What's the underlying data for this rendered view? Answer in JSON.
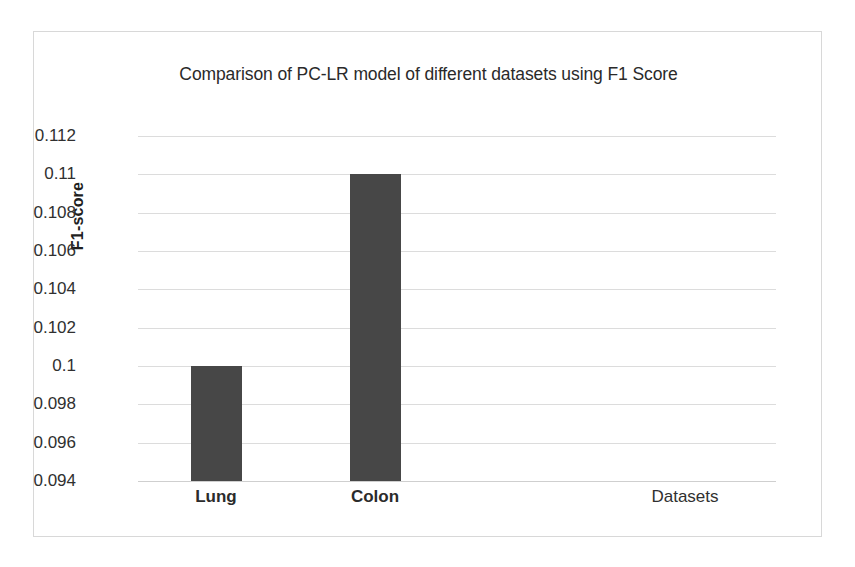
{
  "chart_data": {
    "type": "bar",
    "title": "Comparison of PC-LR model of different datasets using F1 Score",
    "categories": [
      "Lung",
      "Colon"
    ],
    "values": [
      0.1,
      0.11
    ],
    "xlabel": "Datasets",
    "ylabel": "F1-score",
    "ylim": [
      0.094,
      0.112
    ],
    "ytick_step": 0.002,
    "ytick_labels": [
      "0.112",
      "0.11",
      "0.108",
      "0.106",
      "0.104",
      "0.102",
      "0.1",
      "0.098",
      "0.096",
      "0.094"
    ],
    "ytick_values": [
      0.112,
      0.11,
      0.108,
      0.106,
      0.104,
      0.102,
      0.1,
      0.098,
      0.096,
      0.094
    ],
    "grid": true,
    "legend": false,
    "series": [
      {
        "name": "F1 Score",
        "color": "#474747",
        "values": [
          0.1,
          0.11
        ]
      }
    ],
    "colors": {
      "bar": "#474747",
      "gridline": "#dcdcdc",
      "frame": "#d8d8d8",
      "text": "#2a2a2a",
      "background": "#ffffff"
    }
  }
}
